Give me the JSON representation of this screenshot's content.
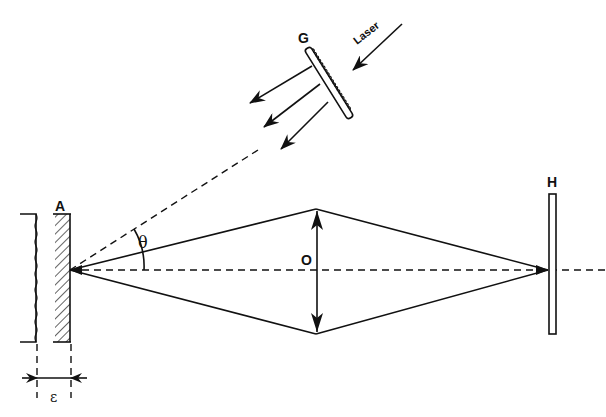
{
  "diagram": {
    "type": "optical-setup",
    "labels": {
      "grating": "G",
      "laser": "Laser",
      "plate": "A",
      "lens": "O",
      "hologram": "H",
      "angle": "θ",
      "thickness": "ε"
    },
    "colors": {
      "ink": "#111111",
      "background": "#ffffff"
    }
  }
}
